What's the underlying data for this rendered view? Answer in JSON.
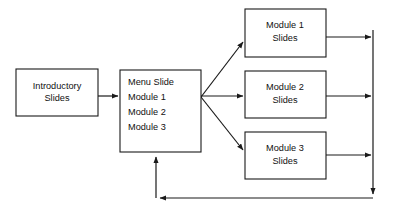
{
  "diagram": {
    "type": "flowchart",
    "background_color": "#ffffff",
    "line_color": "#1a1a1a",
    "box_fill_color": "#ffffff",
    "nodes": {
      "intro": {
        "name": "introductory-slides",
        "lines": [
          "Introductory",
          "Slides"
        ],
        "line1": "Introductory",
        "line2": "Slides",
        "align": "center",
        "x": 16,
        "y": 69,
        "w": 82,
        "h": 47
      },
      "menu": {
        "name": "menu-slide",
        "lines": [
          "Menu Slide",
          "Module 1",
          "Module 2",
          "Module 3"
        ],
        "line1": "Menu Slide",
        "line2": "Module 1",
        "line3": "Module 2",
        "line4": "Module 3",
        "align": "left",
        "x": 120,
        "y": 70,
        "w": 81,
        "h": 82
      },
      "module1": {
        "name": "module-1-slides",
        "lines": [
          "Module 1",
          "Slides"
        ],
        "line1": "Module 1",
        "line2": "Slides",
        "align": "center",
        "x": 245,
        "y": 9,
        "w": 81,
        "h": 48
      },
      "module2": {
        "name": "module-2-slides",
        "lines": [
          "Module 2",
          "Slides"
        ],
        "line1": "Module 2",
        "line2": "Slides",
        "align": "center",
        "x": 245,
        "y": 71,
        "w": 81,
        "h": 47
      },
      "module3": {
        "name": "module-3-slides",
        "lines": [
          "Module 3",
          "Slides"
        ],
        "line1": "Module 3",
        "line2": "Slides",
        "align": "center",
        "x": 245,
        "y": 132,
        "w": 81,
        "h": 47
      }
    },
    "connections": [
      {
        "name": "intro-to-menu",
        "from": "intro",
        "to": "menu",
        "style": "straight-horizontal"
      },
      {
        "name": "menu-to-module-1",
        "from": "menu",
        "to": "module1",
        "style": "diagonal-up"
      },
      {
        "name": "menu-to-module-2",
        "from": "menu",
        "to": "module2",
        "style": "straight-horizontal"
      },
      {
        "name": "menu-to-module-3",
        "from": "menu",
        "to": "module3",
        "style": "diagonal-down"
      },
      {
        "name": "module-1-to-bus",
        "from": "module1",
        "to": "return-bus",
        "style": "straight-horizontal"
      },
      {
        "name": "module-2-to-bus",
        "from": "module2",
        "to": "return-bus",
        "style": "straight-horizontal"
      },
      {
        "name": "module-3-to-bus",
        "from": "module3",
        "to": "return-bus",
        "style": "straight-horizontal"
      },
      {
        "name": "return-bus-to-menu",
        "from": "return-bus",
        "to": "menu",
        "style": "orthogonal-feedback"
      }
    ]
  }
}
